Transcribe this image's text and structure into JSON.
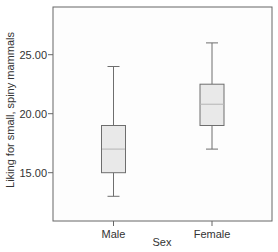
{
  "chart_data": {
    "type": "boxplot",
    "title": "",
    "xlabel": "Sex",
    "ylabel": "Liking for small, spiny mammals",
    "categories": [
      "Male",
      "Female"
    ],
    "y_ticks": [
      "15.00",
      "20.00",
      "25.00"
    ],
    "y_tick_values": [
      15,
      20,
      25
    ],
    "ylim": [
      11.0,
      27.3
    ],
    "grid": false,
    "legend": null,
    "series": [
      {
        "name": "Male",
        "whisker_low": 13,
        "q1": 15,
        "median": 17,
        "q3": 19,
        "whisker_high": 24
      },
      {
        "name": "Female",
        "whisker_low": 17,
        "q1": 19,
        "median": 20.8,
        "q3": 22.5,
        "whisker_high": 26
      }
    ],
    "colors": {
      "box_fill": "#e9e9e9",
      "box_stroke": "#6e6e6e",
      "median": "#bdbdbd",
      "whisker": "#6e6e6e",
      "frame": "#666666",
      "plot_bg": "#fdfdfd"
    }
  }
}
